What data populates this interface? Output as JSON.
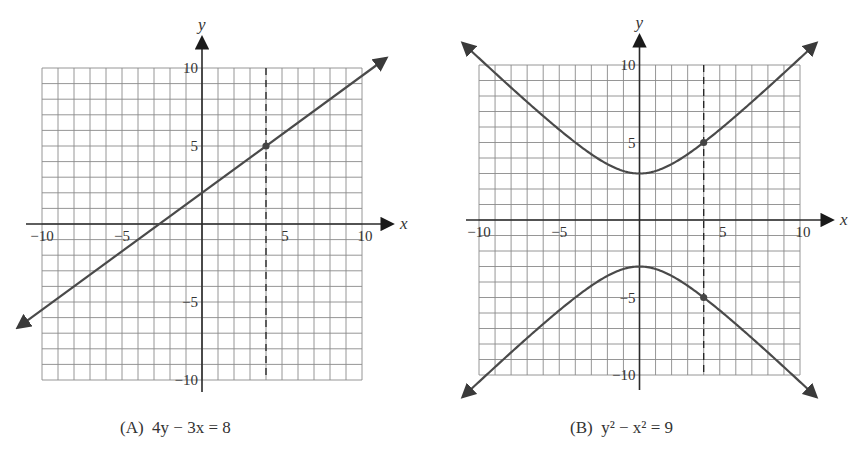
{
  "chart_data": [
    {
      "type": "line",
      "label": "(A)",
      "equation": "4y − 3x = 8",
      "caption": "(A)  4y − 3x = 8",
      "xlabel": "x",
      "ylabel": "y",
      "xlim": [
        -10,
        10
      ],
      "ylim": [
        -10,
        10
      ],
      "grid": true,
      "grid_step": 1,
      "x_ticks": [
        -10,
        -5,
        5,
        10
      ],
      "y_ticks": [
        10,
        5,
        -5,
        -10
      ],
      "series": [
        {
          "name": "4y - 3x = 8",
          "slope": 0.75,
          "intercept": 2,
          "x": [
            -11.5,
            11.5
          ],
          "y": [
            -6.625,
            10.625
          ],
          "arrows": "both"
        }
      ],
      "vertical_dashed_line": {
        "x": 4
      },
      "marked_points": [
        {
          "x": 4,
          "y": 5
        }
      ]
    },
    {
      "type": "line",
      "label": "(B)",
      "equation": "y² − x² = 9",
      "caption": "(B)  y² − x² = 9",
      "xlabel": "x",
      "ylabel": "y",
      "xlim": [
        -10,
        10
      ],
      "ylim": [
        -10,
        10
      ],
      "grid": true,
      "grid_step": 1,
      "x_ticks": [
        -10,
        -5,
        5,
        10
      ],
      "y_ticks": [
        10,
        5,
        -5,
        -10
      ],
      "series": [
        {
          "name": "upper branch y = sqrt(9 + x^2)",
          "x": [
            -11,
            -8,
            -5,
            -4,
            -2,
            0,
            2,
            4,
            5,
            8,
            11
          ],
          "y": [
            11.4,
            8.54,
            5.83,
            5,
            3.61,
            3,
            3.61,
            5,
            5.83,
            8.54,
            11.4
          ],
          "arrows": "both"
        },
        {
          "name": "lower branch y = -sqrt(9 + x^2)",
          "x": [
            -11,
            -8,
            -5,
            -4,
            -2,
            0,
            2,
            4,
            5,
            8,
            11
          ],
          "y": [
            -11.4,
            -8.54,
            -5.83,
            -5,
            -3.61,
            -3,
            -3.61,
            -5,
            -5.83,
            -8.54,
            -11.4
          ],
          "arrows": "both"
        }
      ],
      "vertical_dashed_line": {
        "x": 4
      },
      "marked_points": [
        {
          "x": 4,
          "y": 5
        },
        {
          "x": 4,
          "y": -5
        }
      ]
    }
  ],
  "captions": {
    "a_prefix": "(A)",
    "a_eq": "4y − 3x = 8",
    "b_prefix": "(B)",
    "b_eq": "y² − x² = 9"
  },
  "colors": {
    "grid": "#8a8a8a",
    "axis": "#2a2a2a",
    "curve": "#4a4a4a",
    "text": "#333333"
  }
}
